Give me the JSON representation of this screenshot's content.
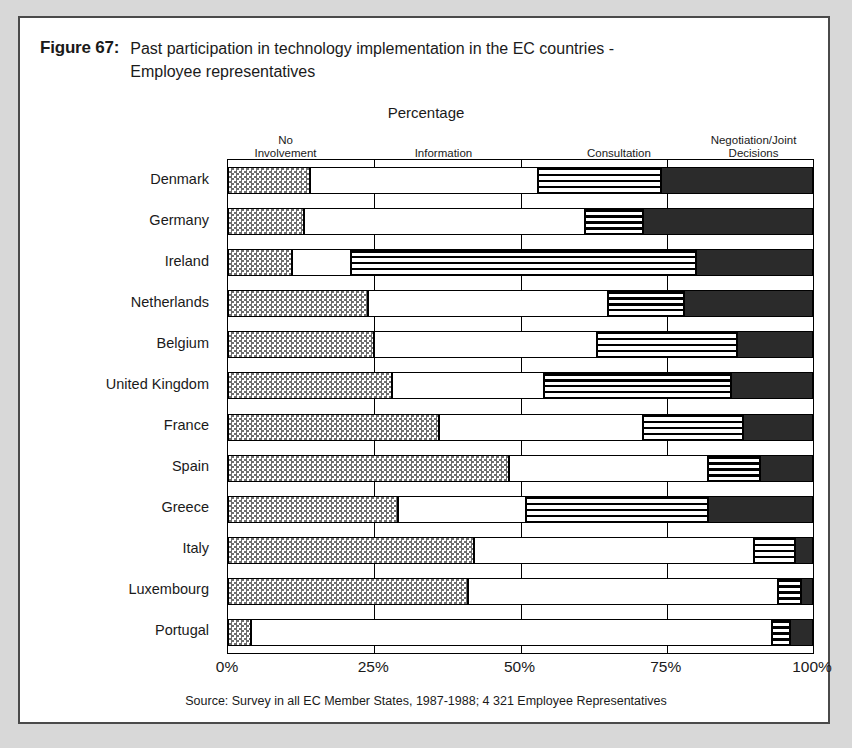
{
  "figure": {
    "number": "Figure 67:",
    "title": "Past participation in technology implementation in the EC countries - Employee representatives",
    "source": "Source: Survey in all EC Member States, 1987-1988; 4 321 Employee Representatives"
  },
  "chart_data": {
    "type": "bar",
    "orientation": "horizontal",
    "stacked": true,
    "stack_total": 100,
    "title": "Percentage",
    "xlabel": "Percentage",
    "ylabel": "",
    "xlim": [
      0,
      100
    ],
    "xticks": [
      "0%",
      "25%",
      "50%",
      "75%",
      "100%"
    ],
    "xtick_values": [
      0,
      25,
      50,
      75,
      100
    ],
    "grid": true,
    "legend_position": "top",
    "categories": [
      "Denmark",
      "Germany",
      "Ireland",
      "Netherlands",
      "Belgium",
      "United Kingdom",
      "France",
      "Spain",
      "Greece",
      "Italy",
      "Luxembourg",
      "Portugal"
    ],
    "series": [
      {
        "name": "No Involvement",
        "pattern": "checkered",
        "color": "#6e6e6e",
        "values": [
          14,
          13,
          11,
          24,
          25,
          28,
          36,
          48,
          29,
          42,
          41,
          4
        ]
      },
      {
        "name": "Information",
        "pattern": "white",
        "color": "#ffffff",
        "values": [
          39,
          48,
          10,
          41,
          38,
          26,
          35,
          34,
          22,
          48,
          53,
          89
        ]
      },
      {
        "name": "Consultation",
        "pattern": "horizontal-stripes",
        "color": "#000000",
        "values": [
          21,
          10,
          59,
          13,
          24,
          32,
          17,
          9,
          31,
          7,
          4,
          3
        ]
      },
      {
        "name": "Negotiation/Joint Decisions",
        "pattern": "solid-black",
        "color": "#2b2b2b",
        "values": [
          26,
          29,
          20,
          22,
          13,
          14,
          12,
          9,
          18,
          3,
          2,
          4
        ]
      }
    ],
    "legend_labels": [
      "No\nInvolvement",
      "Information",
      "Consultation",
      "Negotiation/Joint\nDecisions"
    ]
  },
  "legend": {
    "items": [
      {
        "line1": "No",
        "line2": "Involvement",
        "center_pct": 10
      },
      {
        "line1": "Information",
        "line2": "",
        "center_pct": 37
      },
      {
        "line1": "Consultation",
        "line2": "",
        "center_pct": 67
      },
      {
        "line1": "Negotiation/Joint",
        "line2": "Decisions",
        "center_pct": 90
      }
    ]
  }
}
